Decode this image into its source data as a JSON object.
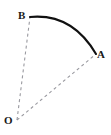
{
  "figure": {
    "kind": "circular-sector-diagram",
    "background_color": "#ffffff",
    "labels": {
      "arc_start_label": "B",
      "arc_end_label": "A",
      "center_label": "O"
    },
    "label_color": "#1a1a1a",
    "arc": {
      "name": "arc-AB",
      "color": "#111111",
      "stroke_width": 2.1,
      "style": "solid",
      "start_point": [
        30,
        17
      ],
      "end_point": [
        96,
        54
      ],
      "control_point": [
        72,
        13
      ]
    },
    "radii": [
      {
        "name": "radius-OB",
        "from": [
          17,
          120
        ],
        "to": [
          30,
          17
        ],
        "color": "#9a9aa0",
        "style": "dashed",
        "stroke_width": 1.1,
        "dash_pattern": "3 3"
      },
      {
        "name": "radius-OA",
        "from": [
          17,
          120
        ],
        "to": [
          96,
          54
        ],
        "color": "#9a9aa0",
        "style": "dashed",
        "stroke_width": 1.1,
        "dash_pattern": "3 3"
      }
    ],
    "points": [
      {
        "name": "point-O",
        "label": "O",
        "x": 17,
        "y": 120
      },
      {
        "name": "point-B",
        "label": "B",
        "x": 30,
        "y": 17
      },
      {
        "name": "point-A",
        "label": "A",
        "x": 96,
        "y": 54
      }
    ]
  }
}
